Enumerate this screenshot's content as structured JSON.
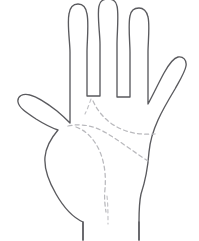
{
  "figure": {
    "name": "open-palm-line-drawing",
    "title": "",
    "background_color": "#ffffff",
    "outline_color": "#5a5a5e",
    "palm_line_color": "#b9b9bd",
    "outline_style": "solid thin contour",
    "palm_line_style": "dashed",
    "orientation": "palm facing viewer, fingers pointing up"
  },
  "anatomy": {
    "digits": [
      {
        "id": "thumb",
        "label": "thumb",
        "tip_position": "left, mid-height"
      },
      {
        "id": "index",
        "label": "index finger",
        "tip_position": "upper left of finger group"
      },
      {
        "id": "middle",
        "label": "middle finger",
        "tip_position": "topmost, tallest"
      },
      {
        "id": "ring",
        "label": "ring finger",
        "tip_position": "upper right of finger group"
      },
      {
        "id": "pinky",
        "label": "little finger",
        "tip_position": "far right, lowest of the four"
      }
    ],
    "regions": [
      {
        "id": "palm",
        "label": "palm"
      },
      {
        "id": "wrist",
        "label": "wrist"
      },
      {
        "id": "thenar",
        "label": "thumb mound"
      }
    ]
  },
  "palm_lines": [
    {
      "id": "heart-line",
      "label": "heart line",
      "style": "dashed",
      "description": "upper dashed curve running from below the index-middle finger gap across to the outer edge of the palm"
    },
    {
      "id": "head-line",
      "label": "head line",
      "style": "dashed",
      "description": "middle dashed curve from the thumb web across the palm toward the outer edge"
    },
    {
      "id": "life-line",
      "label": "life line",
      "style": "dashed",
      "description": "dashed arc curving around the thumb mound from the index base down toward the wrist"
    },
    {
      "id": "fate-line",
      "label": "fate line",
      "style": "dashed",
      "description": "short dashed segment descending toward the base of the palm near the wrist"
    }
  ],
  "labels": {
    "heart_line": "",
    "head_line": "",
    "life_line": "",
    "fate_line": "",
    "caption": ""
  }
}
